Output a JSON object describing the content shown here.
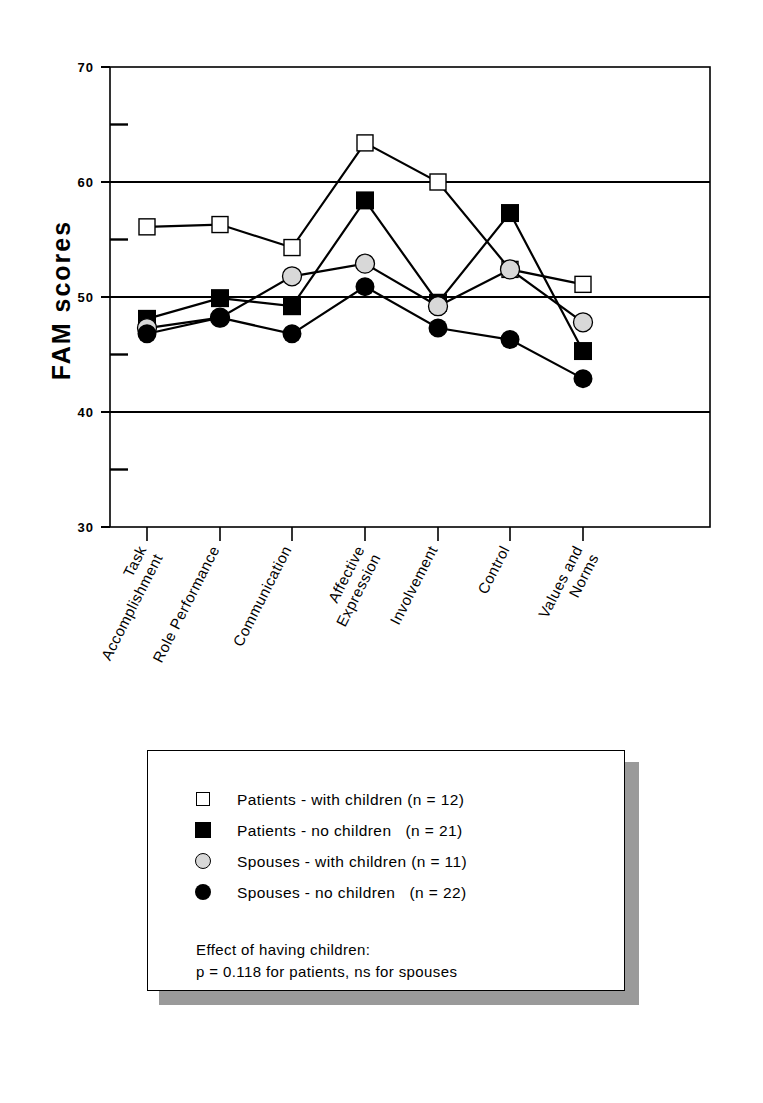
{
  "chart_data": {
    "type": "line",
    "title": "",
    "xlabel": "",
    "ylabel": "FAM scores",
    "ylim": [
      30,
      70
    ],
    "grid": true,
    "grid_values": [
      40,
      50,
      60
    ],
    "y_major_ticks": [
      70,
      60,
      50,
      40,
      30
    ],
    "y_minor_ticks": [
      65,
      55,
      45,
      35
    ],
    "legend_position": "below-plot-boxed",
    "categories": [
      "Task Accomplishment",
      "Role Performance",
      "Communication",
      "Affective Expression",
      "Involvement",
      "Control",
      "Values and Norms"
    ],
    "series": [
      {
        "name": "Patients - with children (n = 12)",
        "marker": "open-square",
        "values": [
          56.1,
          56.3,
          54.3,
          63.4,
          60.0,
          52.4,
          51.1
        ]
      },
      {
        "name": "Patients - no children   (n = 21)",
        "marker": "filled-square",
        "values": [
          48.1,
          49.9,
          49.2,
          58.4,
          49.5,
          57.3,
          45.3
        ]
      },
      {
        "name": "Spouses - with children (n = 11)",
        "marker": "light-circle",
        "values": [
          47.3,
          48.2,
          51.8,
          52.9,
          49.2,
          52.4,
          47.8
        ]
      },
      {
        "name": "Spouses - no children   (n = 22)",
        "marker": "filled-circle",
        "values": [
          46.8,
          48.2,
          46.8,
          50.9,
          47.3,
          46.3,
          42.9
        ]
      }
    ],
    "annotations": [
      "Effect of having children:",
      "p = 0.118 for patients, ns for spouses"
    ]
  },
  "axis": {
    "y_title": "FAM scores",
    "ticks": {
      "t70": "70",
      "t60": "60",
      "t50": "50",
      "t40": "40",
      "t30": "30"
    }
  },
  "categories": {
    "c0_line1": "Task",
    "c0_line2": "Accomplishment",
    "c1_line1": "Role Performance",
    "c2_line1": "Communication",
    "c3_line1": "Affective",
    "c3_line2": "Expression",
    "c4_line1": "Involvement",
    "c5_line1": "Control",
    "c6_line1": "Values and",
    "c6_line2": "Norms"
  },
  "legend": {
    "items": [
      {
        "marker": "open-square",
        "label": "Patients - with children (n = 12)"
      },
      {
        "marker": "filled-square",
        "label": "Patients - no children   (n = 21)"
      },
      {
        "marker": "light-circle",
        "label": "Spouses - with children (n = 11)"
      },
      {
        "marker": "filled-circle",
        "label": "Spouses - no children   (n = 22)"
      }
    ],
    "note_line1": "Effect of having children:",
    "note_line2": "p = 0.118 for patients, ns for spouses"
  },
  "colors": {
    "ink": "#000000",
    "light_marker_fill": "#d8d8d8",
    "paper": "#ffffff",
    "legend_shadow": "#9a9a9a"
  }
}
